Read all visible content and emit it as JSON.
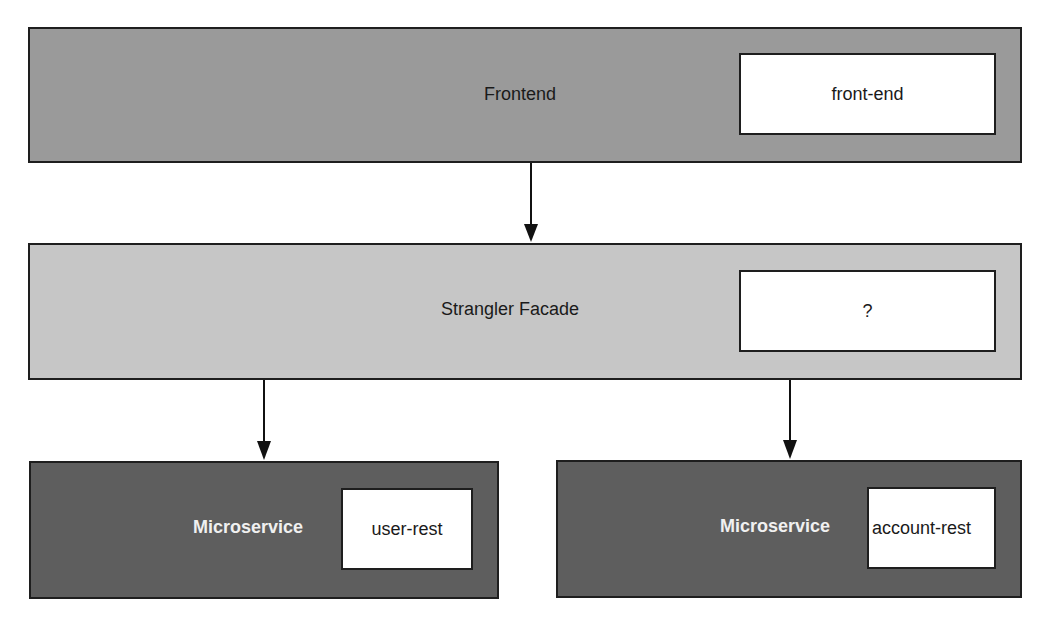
{
  "diagram": {
    "frontend": {
      "label": "Frontend",
      "component": "front-end",
      "fill": "#9a9a9a"
    },
    "facade": {
      "label": "Strangler Facade",
      "component": "?",
      "fill": "#c6c6c6"
    },
    "microservices": [
      {
        "label": "Microservice",
        "component": "user-rest",
        "fill": "#5e5e5e"
      },
      {
        "label": "Microservice",
        "component": "account-rest",
        "fill": "#5e5e5e"
      }
    ],
    "edges": [
      {
        "from": "Frontend",
        "to": "Strangler Facade"
      },
      {
        "from": "Strangler Facade",
        "to": "Microservice (user-rest)"
      },
      {
        "from": "Strangler Facade",
        "to": "Microservice (account-rest)"
      }
    ]
  }
}
